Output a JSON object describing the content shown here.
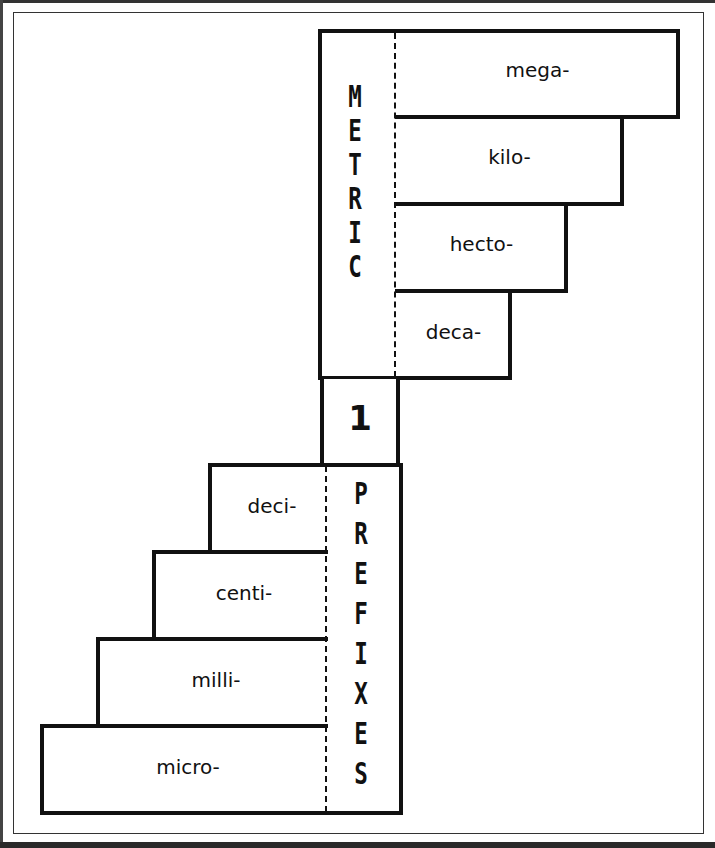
{
  "diagram": {
    "title_top": "METRIC",
    "title_bottom": "PREFIXES",
    "base_unit": "1",
    "larger_prefixes": [
      {
        "label": "mega-"
      },
      {
        "label": "kilo-"
      },
      {
        "label": "hecto-"
      },
      {
        "label": "deca-"
      }
    ],
    "smaller_prefixes": [
      {
        "label": "deci-"
      },
      {
        "label": "centi-"
      },
      {
        "label": "milli-"
      },
      {
        "label": "micro-"
      }
    ]
  }
}
